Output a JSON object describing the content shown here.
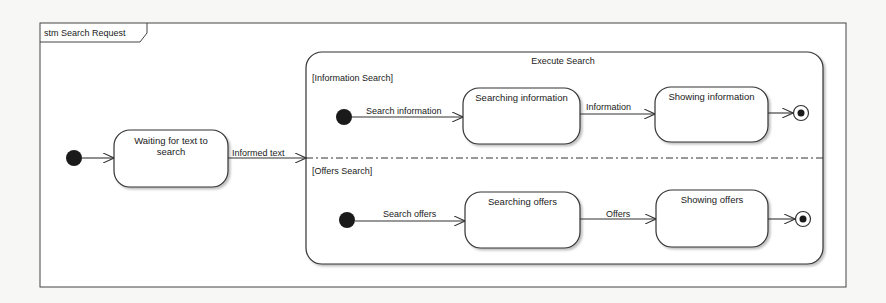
{
  "frame": {
    "title": "stm Search Request"
  },
  "states": {
    "waiting": {
      "label": "Waiting for text to search"
    },
    "composite": {
      "title": "Execute Search",
      "regions": [
        {
          "label": "[Information Search]",
          "states": [
            {
              "label": "Searching information"
            },
            {
              "label": "Showing information"
            }
          ],
          "transitions": [
            {
              "label": "Search information"
            },
            {
              "label": "Information"
            }
          ]
        },
        {
          "label": "[Offers Search]",
          "states": [
            {
              "label": "Searching offers"
            },
            {
              "label": "Showing offers"
            }
          ],
          "transitions": [
            {
              "label": "Search offers"
            },
            {
              "label": "Offers"
            }
          ]
        }
      ]
    }
  },
  "transitions": {
    "informed_text": {
      "label": "Informed text"
    }
  },
  "colors": {
    "stroke": "#333333",
    "fill": "#ffffff",
    "background": "#f7f7f5",
    "pseudostate": "#1a1a1a"
  }
}
